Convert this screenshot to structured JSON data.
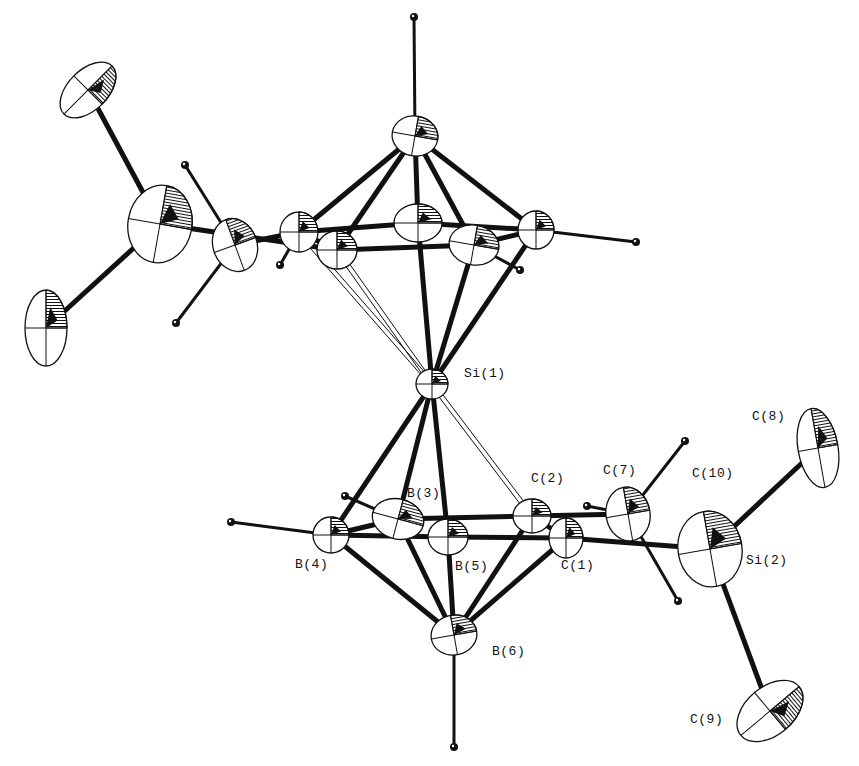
{
  "diagram": {
    "type": "ORTEP thermal-ellipsoid molecular structure",
    "ink_color": "#111111",
    "background": "#ffffff",
    "labels": [
      {
        "id": "Si1",
        "text": "Si(1)",
        "x": 464,
        "y": 374
      },
      {
        "id": "B3",
        "text": "B(3)",
        "x": 407,
        "y": 494
      },
      {
        "id": "C2",
        "text": "C(2)",
        "x": 531,
        "y": 479
      },
      {
        "id": "C7",
        "text": "C(7)",
        "x": 603,
        "y": 471
      },
      {
        "id": "C10",
        "text": "C(10)",
        "x": 692,
        "y": 474
      },
      {
        "id": "C8",
        "text": "C(8)",
        "x": 752,
        "y": 417
      },
      {
        "id": "B4",
        "text": "B(4)",
        "x": 295,
        "y": 565
      },
      {
        "id": "B5",
        "text": "B(5)",
        "x": 455,
        "y": 567
      },
      {
        "id": "C1",
        "text": "C(1)",
        "x": 561,
        "y": 566
      },
      {
        "id": "Si2",
        "text": "Si(2)",
        "x": 746,
        "y": 561
      },
      {
        "id": "B6",
        "text": "B(6)",
        "x": 492,
        "y": 652
      },
      {
        "id": "C9",
        "text": "C(9)",
        "x": 690,
        "y": 720
      }
    ],
    "atoms": [
      {
        "id": "Si1",
        "cx": 432,
        "cy": 384,
        "rx": 16,
        "ry": 15,
        "rot": 0,
        "kind": "ellipsoid"
      },
      {
        "id": "B6",
        "cx": 454,
        "cy": 635,
        "rx": 23,
        "ry": 20,
        "rot": -10,
        "kind": "ellipsoid"
      },
      {
        "id": "B4",
        "cx": 331,
        "cy": 535,
        "rx": 18,
        "ry": 18,
        "rot": 0,
        "kind": "ellipsoid"
      },
      {
        "id": "B3",
        "cx": 398,
        "cy": 519,
        "rx": 26,
        "ry": 20,
        "rot": 15,
        "kind": "ellipsoid"
      },
      {
        "id": "B5",
        "cx": 448,
        "cy": 537,
        "rx": 20,
        "ry": 18,
        "rot": 0,
        "kind": "ellipsoid"
      },
      {
        "id": "C2",
        "cx": 532,
        "cy": 516,
        "rx": 19,
        "ry": 17,
        "rot": 0,
        "kind": "ellipsoid"
      },
      {
        "id": "C1",
        "cx": 566,
        "cy": 538,
        "rx": 17,
        "ry": 20,
        "rot": 0,
        "kind": "ellipsoid"
      },
      {
        "id": "C7",
        "cx": 628,
        "cy": 514,
        "rx": 22,
        "ry": 27,
        "rot": -10,
        "kind": "ellipsoid"
      },
      {
        "id": "Si2",
        "cx": 710,
        "cy": 549,
        "rx": 32,
        "ry": 38,
        "rot": -10,
        "kind": "ellipsoid"
      },
      {
        "id": "C8",
        "cx": 818,
        "cy": 448,
        "rx": 20,
        "ry": 40,
        "rot": -10,
        "kind": "ellipsoid"
      },
      {
        "id": "C9",
        "cx": 770,
        "cy": 711,
        "rx": 24,
        "ry": 38,
        "rot": 50,
        "kind": "ellipsoid"
      },
      {
        "id": "tB6",
        "cx": 415,
        "cy": 136,
        "rx": 23,
        "ry": 20,
        "rot": 10,
        "kind": "ellipsoid"
      },
      {
        "id": "tB4",
        "cx": 536,
        "cy": 230,
        "rx": 18,
        "ry": 19,
        "rot": 0,
        "kind": "ellipsoid"
      },
      {
        "id": "tB3",
        "cx": 418,
        "cy": 223,
        "rx": 24,
        "ry": 19,
        "rot": 0,
        "kind": "ellipsoid"
      },
      {
        "id": "tB5",
        "cx": 474,
        "cy": 245,
        "rx": 25,
        "ry": 20,
        "rot": 10,
        "kind": "ellipsoid"
      },
      {
        "id": "tC2",
        "cx": 299,
        "cy": 232,
        "rx": 19,
        "ry": 20,
        "rot": 0,
        "kind": "ellipsoid"
      },
      {
        "id": "tC1",
        "cx": 337,
        "cy": 250,
        "rx": 20,
        "ry": 19,
        "rot": 0,
        "kind": "ellipsoid"
      },
      {
        "id": "tC7",
        "cx": 235,
        "cy": 245,
        "rx": 22,
        "ry": 27,
        "rot": -20,
        "kind": "ellipsoid"
      },
      {
        "id": "tSi2",
        "cx": 160,
        "cy": 224,
        "rx": 32,
        "ry": 39,
        "rot": 10,
        "kind": "ellipsoid"
      },
      {
        "id": "tC8",
        "cx": 88,
        "cy": 90,
        "rx": 20,
        "ry": 34,
        "rot": 45,
        "kind": "ellipsoid"
      },
      {
        "id": "tC9",
        "cx": 46,
        "cy": 328,
        "rx": 21,
        "ry": 38,
        "rot": 0,
        "kind": "ellipsoid"
      },
      {
        "id": "H_tB6",
        "cx": 414,
        "cy": 17,
        "r": 4,
        "kind": "hydrogen"
      },
      {
        "id": "H_tB4",
        "cx": 636,
        "cy": 242,
        "r": 4,
        "kind": "hydrogen"
      },
      {
        "id": "H_tB5",
        "cx": 520,
        "cy": 270,
        "r": 4,
        "kind": "hydrogen"
      },
      {
        "id": "H_tC2",
        "cx": 280,
        "cy": 265,
        "r": 4,
        "kind": "hydrogen"
      },
      {
        "id": "H_tC7a",
        "cx": 185,
        "cy": 165,
        "r": 4,
        "kind": "hydrogen"
      },
      {
        "id": "H_tC7b",
        "cx": 176,
        "cy": 323,
        "r": 4,
        "kind": "hydrogen"
      },
      {
        "id": "H_B4",
        "cx": 231,
        "cy": 522,
        "r": 4,
        "kind": "hydrogen"
      },
      {
        "id": "H_B3",
        "cx": 345,
        "cy": 496,
        "r": 4,
        "kind": "hydrogen"
      },
      {
        "id": "H_B6",
        "cx": 454,
        "cy": 747,
        "r": 4,
        "kind": "hydrogen"
      },
      {
        "id": "H_C7a",
        "cx": 685,
        "cy": 441,
        "r": 4,
        "kind": "hydrogen"
      },
      {
        "id": "H_C7b",
        "cx": 587,
        "cy": 506,
        "r": 4,
        "kind": "hydrogen"
      },
      {
        "id": "H_C7c",
        "cx": 678,
        "cy": 601,
        "r": 4,
        "kind": "hydrogen"
      }
    ],
    "bonds": [
      {
        "a": "Si1",
        "b": "B4",
        "style": "thick"
      },
      {
        "a": "Si1",
        "b": "B3",
        "style": "thick"
      },
      {
        "a": "Si1",
        "b": "B5",
        "style": "thick"
      },
      {
        "a": "Si1",
        "b": "C2",
        "style": "open"
      },
      {
        "a": "B6",
        "b": "B4",
        "style": "thick"
      },
      {
        "a": "B6",
        "b": "B3",
        "style": "thick"
      },
      {
        "a": "B6",
        "b": "B5",
        "style": "thick"
      },
      {
        "a": "B6",
        "b": "C2",
        "style": "thick"
      },
      {
        "a": "B6",
        "b": "C1",
        "style": "thick"
      },
      {
        "a": "B4",
        "b": "B3",
        "style": "thick"
      },
      {
        "a": "B4",
        "b": "B5",
        "style": "thick"
      },
      {
        "a": "B3",
        "b": "C2",
        "style": "thick"
      },
      {
        "a": "B5",
        "b": "C1",
        "style": "thick"
      },
      {
        "a": "C2",
        "b": "C1",
        "style": "thick"
      },
      {
        "a": "C2",
        "b": "C7",
        "style": "thick"
      },
      {
        "a": "C1",
        "b": "Si2",
        "style": "thick"
      },
      {
        "a": "Si2",
        "b": "C8",
        "style": "thick"
      },
      {
        "a": "Si2",
        "b": "C9",
        "style": "thick"
      },
      {
        "a": "B4",
        "b": "H_B4",
        "style": "thin"
      },
      {
        "a": "B3",
        "b": "H_B3",
        "style": "thin"
      },
      {
        "a": "B6",
        "b": "H_B6",
        "style": "thin"
      },
      {
        "a": "C7",
        "b": "H_C7a",
        "style": "thin"
      },
      {
        "a": "C7",
        "b": "H_C7b",
        "style": "thin"
      },
      {
        "a": "C7",
        "b": "H_C7c",
        "style": "thin"
      },
      {
        "a": "Si1",
        "b": "tB4",
        "style": "thick"
      },
      {
        "a": "Si1",
        "b": "tB3",
        "style": "thick"
      },
      {
        "a": "Si1",
        "b": "tB5",
        "style": "thick"
      },
      {
        "a": "Si1",
        "b": "tC2",
        "style": "open"
      },
      {
        "a": "Si1",
        "b": "tC1",
        "style": "open"
      },
      {
        "a": "tB6",
        "b": "tB4",
        "style": "thick"
      },
      {
        "a": "tB6",
        "b": "tB3",
        "style": "thick"
      },
      {
        "a": "tB6",
        "b": "tB5",
        "style": "thick"
      },
      {
        "a": "tB6",
        "b": "tC2",
        "style": "thick"
      },
      {
        "a": "tB6",
        "b": "tC1",
        "style": "thick"
      },
      {
        "a": "tC2",
        "b": "tB3",
        "style": "thick"
      },
      {
        "a": "tB3",
        "b": "tB4",
        "style": "thick"
      },
      {
        "a": "tC1",
        "b": "tB5",
        "style": "thick"
      },
      {
        "a": "tB5",
        "b": "tB4",
        "style": "thick"
      },
      {
        "a": "tC2",
        "b": "tC1",
        "style": "thick"
      },
      {
        "a": "tC2",
        "b": "tC7",
        "style": "thick"
      },
      {
        "a": "tC1",
        "b": "tSi2",
        "style": "thick"
      },
      {
        "a": "tSi2",
        "b": "tC8",
        "style": "thick"
      },
      {
        "a": "tSi2",
        "b": "tC9",
        "style": "thick"
      },
      {
        "a": "tB6",
        "b": "H_tB6",
        "style": "thin"
      },
      {
        "a": "tB4",
        "b": "H_tB4",
        "style": "thin"
      },
      {
        "a": "tB5",
        "b": "H_tB5",
        "style": "thin"
      },
      {
        "a": "tC2",
        "b": "H_tC2",
        "style": "thin"
      },
      {
        "a": "tC7",
        "b": "H_tC7a",
        "style": "thin"
      },
      {
        "a": "tC7",
        "b": "H_tC7b",
        "style": "thin"
      }
    ]
  }
}
